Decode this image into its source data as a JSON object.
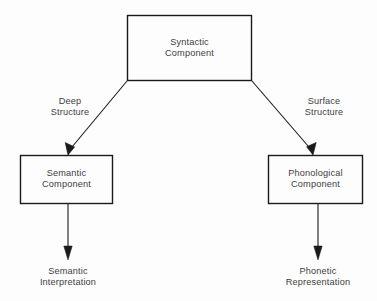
{
  "diagram": {
    "type": "flow-diagram",
    "background_color": "#fdfdfd",
    "line_color": "#1a1a1a",
    "text_color": "#3d3d3d",
    "nodes": {
      "syntactic": {
        "label": "Syntactic\nComponent",
        "shape": "rectangle",
        "x": 127,
        "y": 15,
        "width": 125,
        "height": 66
      },
      "semantic": {
        "label": "Semantic\nComponent",
        "shape": "rectangle",
        "x": 20,
        "y": 155,
        "width": 93,
        "height": 49
      },
      "phonological": {
        "label": "Phonological\nComponent",
        "shape": "rectangle",
        "x": 268,
        "y": 155,
        "width": 95,
        "height": 49
      }
    },
    "edge_labels": {
      "deep_structure": "Deep\nStructure",
      "surface_structure": "Surface\nStructure"
    },
    "outputs": {
      "semantic_interpretation": "Semantic\nInterpretation",
      "phonetic_representation": "Phonetic\nRepresentation"
    },
    "edges": [
      {
        "name": "syntactic-to-semantic",
        "from": "syntactic",
        "to": "semantic",
        "label": "Deep Structure",
        "style": "diagonal-arrow"
      },
      {
        "name": "syntactic-to-phonological",
        "from": "syntactic",
        "to": "phonological",
        "label": "Surface Structure",
        "style": "diagonal-arrow"
      },
      {
        "name": "semantic-to-interpretation",
        "from": "semantic",
        "to": "semantic_interpretation",
        "label": "",
        "style": "vertical-arrow"
      },
      {
        "name": "phonological-to-representation",
        "from": "phonological",
        "to": "phonetic_representation",
        "label": "",
        "style": "vertical-arrow"
      }
    ]
  }
}
